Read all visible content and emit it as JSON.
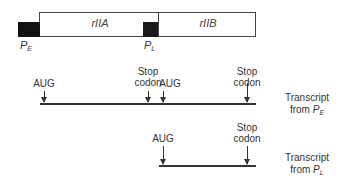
{
  "gene_map": {
    "genes": [
      {
        "name": "rIIA"
      },
      {
        "name": "rIIB"
      }
    ],
    "promoters": [
      {
        "symbol": "P",
        "subscript": "E"
      },
      {
        "symbol": "P",
        "subscript": "L"
      }
    ]
  },
  "transcripts": [
    {
      "label_line1": "Transcript",
      "label_line2_prefix": "from ",
      "label_symbol": "P",
      "label_subscript": "E",
      "markers": [
        {
          "text": "AUG"
        },
        {
          "text_line1": "Stop",
          "text_line2": "codon"
        },
        {
          "text": "AUG"
        },
        {
          "text_line1": "Stop",
          "text_line2": "codon"
        }
      ]
    },
    {
      "label_line1": "Transcript",
      "label_line2_prefix": "from ",
      "label_symbol": "P",
      "label_subscript": "L",
      "markers": [
        {
          "text": "AUG"
        },
        {
          "text_line1": "Stop",
          "text_line2": "codon"
        }
      ]
    }
  ]
}
